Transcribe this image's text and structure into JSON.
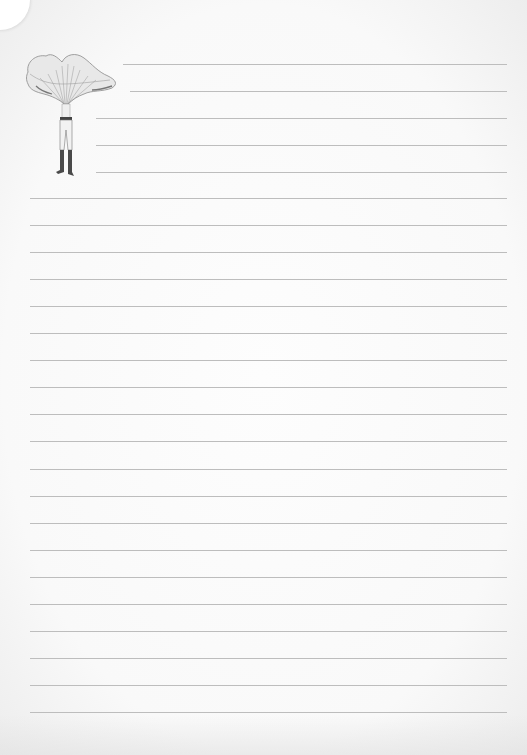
{
  "page": {
    "type": "lined-notepaper",
    "background_color": "#fbfbfb",
    "line_color": "#bdbdbd"
  },
  "illustration": {
    "subject": "chanterelle-mushroom-headed-figure",
    "description": "Engraving of a man whose head is a large chanterelle mushroom, wearing trousers and tall dark boots"
  },
  "lines": {
    "short": [
      {
        "y": 64,
        "x1": 123,
        "x2": 507
      },
      {
        "y": 91,
        "x1": 130,
        "x2": 507
      },
      {
        "y": 118,
        "x1": 96,
        "x2": 507
      },
      {
        "y": 145,
        "x1": 96,
        "x2": 507
      },
      {
        "y": 172,
        "x1": 96,
        "x2": 507
      }
    ],
    "full_start_y": 198,
    "full_count": 20,
    "full_spacing": 27.05,
    "full_x1": 30,
    "full_x2": 507
  }
}
